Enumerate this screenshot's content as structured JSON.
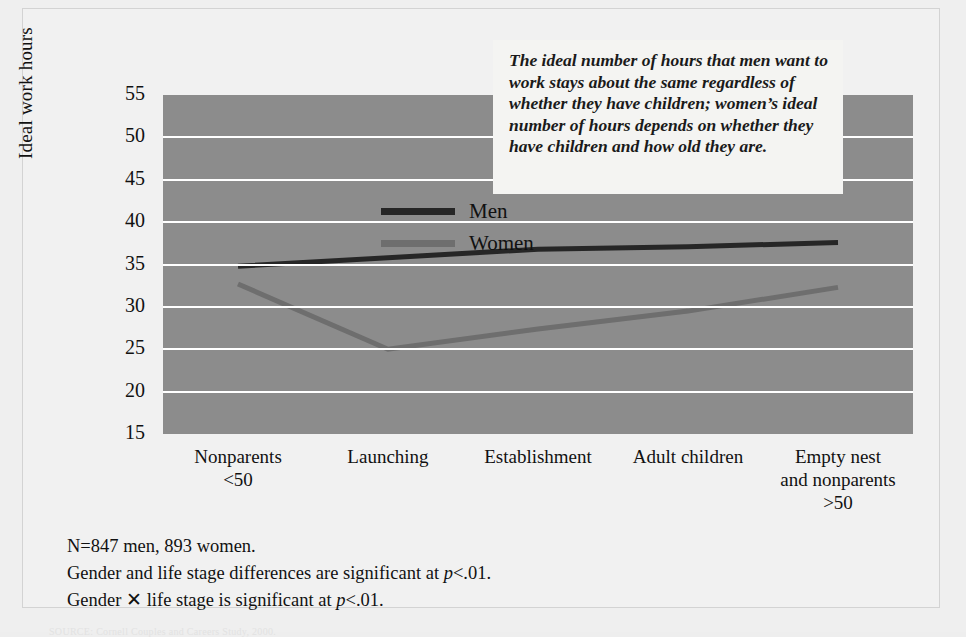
{
  "figure": {
    "background_color": "#efefef",
    "plot_background_color": "#8c8c8c",
    "gridline_color": "#ffffff"
  },
  "callout": {
    "text": "The ideal number of hours that men want to work stays about the same regardless of whether they have children; women’s ideal number of hours depends on whether they have children and how old they are."
  },
  "notes": {
    "line1": "N=847 men, 893 women.",
    "line2_a": "Gender and life stage differences are significant at ",
    "line2_p": "p",
    "line2_b": "<.01.",
    "line3_a": "Gender ",
    "line3_x": "✕",
    "line3_b": " life stage is significant at ",
    "line3_p": "p",
    "line3_c": "<.01."
  },
  "source": {
    "text": "SOURCE: Cornell Couples and Careers Study, 2000."
  },
  "chart_data": {
    "type": "line",
    "title": "",
    "xlabel": "",
    "ylabel": "Ideal work hours",
    "categories": [
      "Nonparents\n<50",
      "Launching",
      "Establishment",
      "Adult children",
      "Empty nest\nand nonparents\n>50"
    ],
    "category_lines": [
      [
        "Nonparents",
        "<50"
      ],
      [
        "Launching"
      ],
      [
        "Establishment"
      ],
      [
        "Adult children"
      ],
      [
        "Empty nest",
        "and nonparents",
        ">50"
      ]
    ],
    "ylim": [
      15,
      55
    ],
    "yticks": [
      15,
      20,
      25,
      30,
      35,
      40,
      45,
      50,
      55
    ],
    "grid": true,
    "legend_position": "upper-left-inside",
    "series": [
      {
        "name": "Men",
        "color": "#262626",
        "values": [
          34.8,
          35.8,
          36.8,
          37.1,
          37.6
        ]
      },
      {
        "name": "Women",
        "color": "#6e6e6e",
        "values": [
          32.7,
          25.0,
          27.4,
          29.5,
          32.3
        ]
      }
    ]
  }
}
